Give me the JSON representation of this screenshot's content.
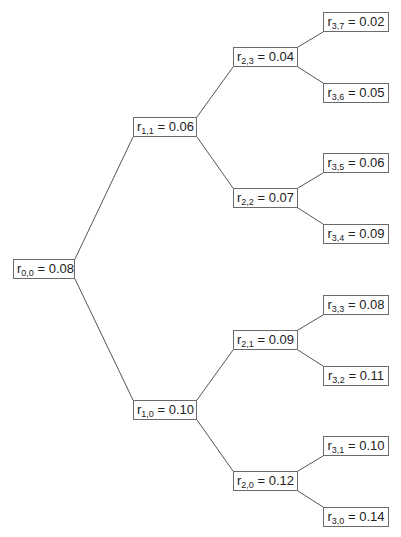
{
  "diagram": {
    "type": "binomial-interest-rate-tree",
    "nodes": [
      {
        "id": "r00",
        "sym": "r",
        "sub": "0,0",
        "value": "0.08",
        "x": 13,
        "y": 259,
        "w": 62
      },
      {
        "id": "r11",
        "sym": "r",
        "sub": "1,1",
        "value": "0.06",
        "x": 133,
        "y": 117,
        "w": 64
      },
      {
        "id": "r10",
        "sym": "r",
        "sub": "1,0",
        "value": "0.10",
        "x": 133,
        "y": 400,
        "w": 64
      },
      {
        "id": "r23",
        "sym": "r",
        "sub": "2,3",
        "value": "0.04",
        "x": 233,
        "y": 47,
        "w": 65
      },
      {
        "id": "r22",
        "sym": "r",
        "sub": "2,2",
        "value": "0.07",
        "x": 233,
        "y": 188,
        "w": 65
      },
      {
        "id": "r21",
        "sym": "r",
        "sub": "2,1",
        "value": "0.09",
        "x": 233,
        "y": 330,
        "w": 65
      },
      {
        "id": "r20",
        "sym": "r",
        "sub": "2,0",
        "value": "0.12",
        "x": 233,
        "y": 471,
        "w": 65
      },
      {
        "id": "r37",
        "sym": "r",
        "sub": "3,7",
        "value": "0.02",
        "x": 323,
        "y": 12,
        "w": 66
      },
      {
        "id": "r36",
        "sym": "r",
        "sub": "3,6",
        "value": "0.05",
        "x": 323,
        "y": 83,
        "w": 66
      },
      {
        "id": "r35",
        "sym": "r",
        "sub": "3,5",
        "value": "0.06",
        "x": 323,
        "y": 153,
        "w": 66
      },
      {
        "id": "r34",
        "sym": "r",
        "sub": "3,4",
        "value": "0.09",
        "x": 323,
        "y": 224,
        "w": 66
      },
      {
        "id": "r33",
        "sym": "r",
        "sub": "3,3",
        "value": "0.08",
        "x": 323,
        "y": 295,
        "w": 66
      },
      {
        "id": "r32",
        "sym": "r",
        "sub": "3,2",
        "value": "0.11",
        "x": 323,
        "y": 366,
        "w": 66
      },
      {
        "id": "r31",
        "sym": "r",
        "sub": "3,1",
        "value": "0.10",
        "x": 323,
        "y": 436,
        "w": 66
      },
      {
        "id": "r30",
        "sym": "r",
        "sub": "3,0",
        "value": "0.14",
        "x": 323,
        "y": 507,
        "w": 66
      }
    ],
    "edges": [
      [
        "r00",
        "r11"
      ],
      [
        "r00",
        "r10"
      ],
      [
        "r11",
        "r23"
      ],
      [
        "r11",
        "r22"
      ],
      [
        "r10",
        "r21"
      ],
      [
        "r10",
        "r20"
      ],
      [
        "r23",
        "r37"
      ],
      [
        "r23",
        "r36"
      ],
      [
        "r22",
        "r35"
      ],
      [
        "r22",
        "r34"
      ],
      [
        "r21",
        "r33"
      ],
      [
        "r21",
        "r32"
      ],
      [
        "r20",
        "r31"
      ],
      [
        "r20",
        "r30"
      ]
    ]
  }
}
